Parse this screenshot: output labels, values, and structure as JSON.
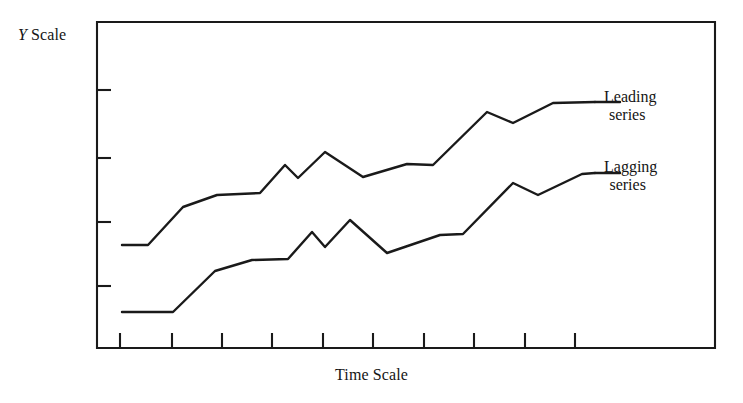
{
  "figure": {
    "y_axis_label_italic": "Y",
    "y_axis_label_rest": " Scale",
    "x_axis_label": "Time Scale",
    "line_color": "#1a1a1a",
    "background_color": "#ffffff",
    "frame_color": "#1a1a1a"
  },
  "annotations": {
    "leading": {
      "line1": "Leading",
      "line2": "series"
    },
    "lagging": {
      "line1": "Lagging",
      "line2": "series"
    }
  },
  "chart_data": {
    "type": "line",
    "title": "",
    "subtitle": "",
    "xlabel": "Time Scale",
    "ylabel": "Y Scale",
    "grid": false,
    "legend_position": "right-inline-labels",
    "axis_tick_labels_shown": false,
    "x_axis": {
      "label": "Time Scale",
      "tick_count": 10,
      "tick_positions_px": [
        120,
        172,
        222,
        272,
        323,
        373,
        424,
        474,
        525,
        575
      ],
      "range_px": [
        97,
        715
      ],
      "tick_labels": []
    },
    "y_axis": {
      "label": "Y Scale",
      "tick_count": 4,
      "tick_positions_px": [
        90,
        158,
        222,
        286
      ],
      "range_px": [
        22,
        348
      ],
      "tick_labels": []
    },
    "series": [
      {
        "name": "Leading series",
        "label_line1": "Leading",
        "label_line2": "series",
        "color": "#1a1a1a",
        "points_px": [
          [
            122,
            245
          ],
          [
            148,
            245
          ],
          [
            183,
            207
          ],
          [
            217,
            195
          ],
          [
            260,
            193
          ],
          [
            285,
            165
          ],
          [
            298,
            178
          ],
          [
            325,
            152
          ],
          [
            363,
            177
          ],
          [
            407,
            164
          ],
          [
            433,
            165
          ],
          [
            487,
            112
          ],
          [
            513,
            123
          ],
          [
            553,
            103
          ],
          [
            595,
            102
          ]
        ],
        "values": [
          2.0,
          2.0,
          3.2,
          3.6,
          3.6,
          4.5,
          4.1,
          4.9,
          4.1,
          4.5,
          4.5,
          6.1,
          5.8,
          6.4,
          6.4
        ]
      },
      {
        "name": "Lagging series",
        "label_line1": "Lagging",
        "label_line2": "series",
        "color": "#1a1a1a",
        "points_px": [
          [
            122,
            312
          ],
          [
            173,
            312
          ],
          [
            215,
            271
          ],
          [
            252,
            260
          ],
          [
            288,
            259
          ],
          [
            312,
            232
          ],
          [
            325,
            247
          ],
          [
            350,
            220
          ],
          [
            387,
            253
          ],
          [
            440,
            235
          ],
          [
            463,
            234
          ],
          [
            513,
            183
          ],
          [
            538,
            195
          ],
          [
            582,
            174
          ],
          [
            595,
            173
          ]
        ],
        "values": [
          0.0,
          0.0,
          1.3,
          1.6,
          1.6,
          2.5,
          2.0,
          2.8,
          1.8,
          2.4,
          2.4,
          4.0,
          3.6,
          4.3,
          4.3
        ]
      }
    ]
  }
}
